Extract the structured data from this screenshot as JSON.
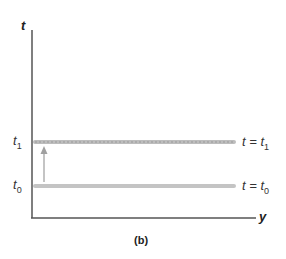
{
  "diagram": {
    "caption": "(b)",
    "axes": {
      "vertical_label": "t",
      "horizontal_label": "y"
    },
    "levels": [
      {
        "id": "t1",
        "tick_base": "t",
        "tick_sub": "1",
        "eq_left": "t = t",
        "eq_sub": "1",
        "style": "dotted-gray"
      },
      {
        "id": "t0",
        "tick_base": "t",
        "tick_sub": "0",
        "eq_left": "t = t",
        "eq_sub": "0",
        "style": "solid-gray"
      }
    ],
    "arrow": {
      "from": "t0",
      "to": "t1",
      "direction": "up"
    },
    "colors": {
      "axis": "#555555",
      "level_line": "#b8b8b8",
      "arrow": "#a0a0a0"
    }
  }
}
